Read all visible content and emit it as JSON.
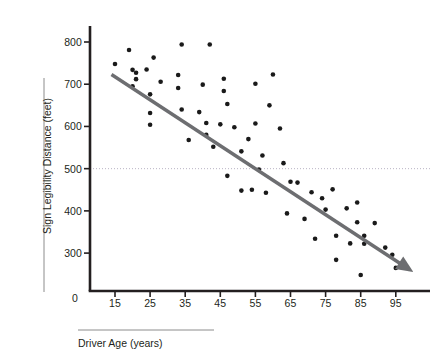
{
  "chart_data": {
    "type": "scatter",
    "title": "",
    "xlabel": "Driver Age (years)",
    "ylabel": "Sign Legibility Distance (feet)",
    "xlim": [
      10,
      100
    ],
    "ylim": [
      230,
      830
    ],
    "xticks": [
      15,
      25,
      35,
      45,
      55,
      65,
      75,
      85,
      95
    ],
    "yticks": [
      300,
      400,
      500,
      600,
      700,
      800
    ],
    "origin_label": "0",
    "grid": false,
    "legend": null,
    "reference_line": {
      "name": "reference-line-500",
      "axis": "y",
      "value": 500,
      "style": "dotted",
      "color": "#b9b3c4"
    },
    "trend_line": {
      "name": "regression-trend-line",
      "style": "solid-arrow",
      "color": "#6d6e71",
      "x_start": 14,
      "y_start": 723,
      "x_end": 100,
      "y_end": 255
    },
    "points": [
      {
        "x": 15,
        "y": 748
      },
      {
        "x": 19,
        "y": 781
      },
      {
        "x": 20,
        "y": 734
      },
      {
        "x": 20,
        "y": 695
      },
      {
        "x": 21,
        "y": 727
      },
      {
        "x": 21,
        "y": 712
      },
      {
        "x": 24,
        "y": 735
      },
      {
        "x": 25,
        "y": 676
      },
      {
        "x": 25,
        "y": 632
      },
      {
        "x": 25,
        "y": 604
      },
      {
        "x": 26,
        "y": 763
      },
      {
        "x": 28,
        "y": 706
      },
      {
        "x": 33,
        "y": 722
      },
      {
        "x": 33,
        "y": 691
      },
      {
        "x": 34,
        "y": 794
      },
      {
        "x": 34,
        "y": 640
      },
      {
        "x": 36,
        "y": 568
      },
      {
        "x": 39,
        "y": 634
      },
      {
        "x": 40,
        "y": 699
      },
      {
        "x": 41,
        "y": 608
      },
      {
        "x": 41,
        "y": 580
      },
      {
        "x": 42,
        "y": 794
      },
      {
        "x": 43,
        "y": 552
      },
      {
        "x": 45,
        "y": 605
      },
      {
        "x": 46,
        "y": 713
      },
      {
        "x": 46,
        "y": 684
      },
      {
        "x": 47,
        "y": 653
      },
      {
        "x": 47,
        "y": 483
      },
      {
        "x": 49,
        "y": 598
      },
      {
        "x": 51,
        "y": 541
      },
      {
        "x": 51,
        "y": 448
      },
      {
        "x": 53,
        "y": 570
      },
      {
        "x": 54,
        "y": 450
      },
      {
        "x": 55,
        "y": 701
      },
      {
        "x": 55,
        "y": 607
      },
      {
        "x": 56,
        "y": 498
      },
      {
        "x": 57,
        "y": 531
      },
      {
        "x": 58,
        "y": 443
      },
      {
        "x": 59,
        "y": 650
      },
      {
        "x": 60,
        "y": 723
      },
      {
        "x": 62,
        "y": 595
      },
      {
        "x": 63,
        "y": 513
      },
      {
        "x": 64,
        "y": 394
      },
      {
        "x": 65,
        "y": 469
      },
      {
        "x": 67,
        "y": 467
      },
      {
        "x": 69,
        "y": 381
      },
      {
        "x": 71,
        "y": 444
      },
      {
        "x": 72,
        "y": 334
      },
      {
        "x": 74,
        "y": 430
      },
      {
        "x": 75,
        "y": 403
      },
      {
        "x": 77,
        "y": 451
      },
      {
        "x": 78,
        "y": 341
      },
      {
        "x": 78,
        "y": 284
      },
      {
        "x": 81,
        "y": 406
      },
      {
        "x": 82,
        "y": 323
      },
      {
        "x": 84,
        "y": 420
      },
      {
        "x": 84,
        "y": 373
      },
      {
        "x": 85,
        "y": 248
      },
      {
        "x": 86,
        "y": 341
      },
      {
        "x": 86,
        "y": 322
      },
      {
        "x": 89,
        "y": 371
      },
      {
        "x": 92,
        "y": 313
      },
      {
        "x": 94,
        "y": 296
      },
      {
        "x": 95,
        "y": 265
      },
      {
        "x": 97,
        "y": 273
      }
    ]
  },
  "axis": {
    "x_title": "Driver Age (years)",
    "y_title": "Sign Legibility Distance (feet)",
    "zero": "0",
    "y_tick_labels": [
      "800",
      "700",
      "600",
      "500",
      "400",
      "300"
    ],
    "x_tick_labels": [
      "15",
      "25",
      "35",
      "45",
      "55",
      "65",
      "75",
      "85",
      "95"
    ]
  },
  "colors": {
    "axis": "#231f20",
    "point": "#1a1a1a",
    "trend": "#6d6e71",
    "reference": "#bdb7c6",
    "rule": "#8c8c8c"
  }
}
